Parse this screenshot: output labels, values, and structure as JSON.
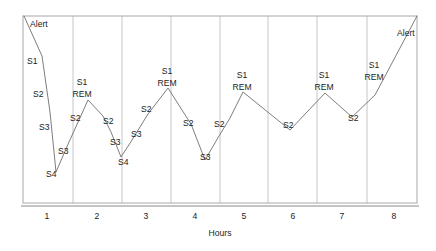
{
  "chart_data": {
    "type": "line",
    "title": "",
    "xlabel": "Hours",
    "ylabel": "",
    "xlim": [
      0.5,
      8.5
    ],
    "ylim": [
      0,
      5
    ],
    "grid": true,
    "legend_position": "none",
    "x_tick_labels": [
      "1",
      "2",
      "3",
      "4",
      "5",
      "6",
      "7",
      "8"
    ],
    "x_tick_values": [
      1,
      2,
      3,
      4,
      5,
      6,
      7,
      8
    ],
    "stage_levels": {
      "Alert": 5,
      "S1": 4,
      "REM": 4,
      "S2": 3,
      "S3": 2,
      "S4": 1
    },
    "series": [
      {
        "name": "Sleep stage",
        "points": [
          {
            "x": 0.5,
            "y": 5.0,
            "stage": "Alert"
          },
          {
            "x": 0.72,
            "y": 4.05,
            "stage": "S1"
          },
          {
            "x": 0.95,
            "y": 3.2,
            "stage": "S2"
          },
          {
            "x": 1.1,
            "y": 2.35,
            "stage": "S3"
          },
          {
            "x": 1.42,
            "y": 1.0,
            "stage": "S4"
          },
          {
            "x": 1.72,
            "y": 2.1,
            "stage": "S3"
          },
          {
            "x": 1.95,
            "y": 2.95,
            "stage": "S2"
          },
          {
            "x": 2.1,
            "y": 4.0,
            "stage": "S1 REM"
          },
          {
            "x": 2.48,
            "y": 2.95,
            "stage": "S2"
          },
          {
            "x": 2.72,
            "y": 2.3,
            "stage": "S3"
          },
          {
            "x": 2.95,
            "y": 1.42,
            "stage": "S4"
          },
          {
            "x": 3.2,
            "y": 2.35,
            "stage": "S3"
          },
          {
            "x": 3.42,
            "y": 3.15,
            "stage": "S2"
          },
          {
            "x": 3.62,
            "y": 4.2,
            "stage": "S1 REM"
          },
          {
            "x": 4.05,
            "y": 3.0,
            "stage": "S2"
          },
          {
            "x": 4.35,
            "y": 1.9,
            "stage": "S3"
          },
          {
            "x": 4.72,
            "y": 3.05,
            "stage": "S2"
          },
          {
            "x": 4.95,
            "y": 4.1,
            "stage": "S1 REM"
          },
          {
            "x": 5.62,
            "y": 2.75,
            "stage": "S2"
          },
          {
            "x": 6.35,
            "y": 4.05,
            "stage": "S1 REM"
          },
          {
            "x": 6.98,
            "y": 3.3,
            "stage": "S2"
          },
          {
            "x": 7.42,
            "y": 4.0,
            "stage": "S1 REM"
          },
          {
            "x": 8.5,
            "y": 5.0,
            "stage": "Alert"
          }
        ]
      }
    ],
    "annotations": [
      {
        "text": "Alert",
        "x_px": 30,
        "y_px": 25,
        "anchor": "start"
      },
      {
        "text": "S1",
        "x_px": 27,
        "y_px": 62,
        "anchor": "start"
      },
      {
        "text": "S2",
        "x_px": 33,
        "y_px": 95,
        "anchor": "start"
      },
      {
        "text": "S3",
        "x_px": 39,
        "y_px": 128,
        "anchor": "start"
      },
      {
        "text": "S4",
        "x_px": 46,
        "y_px": 175,
        "anchor": "start"
      },
      {
        "text": "S3",
        "x_px": 58,
        "y_px": 152,
        "anchor": "start"
      },
      {
        "text": "S2",
        "x_px": 70,
        "y_px": 119,
        "anchor": "start"
      },
      {
        "text": "S1",
        "x_px": 82,
        "y_px": 83,
        "anchor": "middle"
      },
      {
        "text": "REM",
        "x_px": 82,
        "y_px": 95,
        "anchor": "middle"
      },
      {
        "text": "S2",
        "x_px": 103,
        "y_px": 122,
        "anchor": "start"
      },
      {
        "text": "S3",
        "x_px": 110,
        "y_px": 143,
        "anchor": "start"
      },
      {
        "text": "S4",
        "x_px": 118,
        "y_px": 163,
        "anchor": "start"
      },
      {
        "text": "S3",
        "x_px": 131,
        "y_px": 135,
        "anchor": "start"
      },
      {
        "text": "S2",
        "x_px": 141,
        "y_px": 110,
        "anchor": "start"
      },
      {
        "text": "S1",
        "x_px": 167,
        "y_px": 72,
        "anchor": "middle"
      },
      {
        "text": "REM",
        "x_px": 167,
        "y_px": 84,
        "anchor": "middle"
      },
      {
        "text": "S2",
        "x_px": 183,
        "y_px": 124,
        "anchor": "start"
      },
      {
        "text": "S3",
        "x_px": 200,
        "y_px": 158,
        "anchor": "start"
      },
      {
        "text": "S2",
        "x_px": 214,
        "y_px": 125,
        "anchor": "start"
      },
      {
        "text": "S1",
        "x_px": 242,
        "y_px": 76,
        "anchor": "middle"
      },
      {
        "text": "REM",
        "x_px": 242,
        "y_px": 88,
        "anchor": "middle"
      },
      {
        "text": "S2",
        "x_px": 283,
        "y_px": 126,
        "anchor": "start"
      },
      {
        "text": "S1",
        "x_px": 324,
        "y_px": 76,
        "anchor": "middle"
      },
      {
        "text": "REM",
        "x_px": 324,
        "y_px": 88,
        "anchor": "middle"
      },
      {
        "text": "S2",
        "x_px": 348,
        "y_px": 119,
        "anchor": "start"
      },
      {
        "text": "S1",
        "x_px": 374,
        "y_px": 66,
        "anchor": "middle"
      },
      {
        "text": "REM",
        "x_px": 374,
        "y_px": 78,
        "anchor": "middle"
      },
      {
        "text": "Alert",
        "x_px": 397,
        "y_px": 34,
        "anchor": "start"
      }
    ],
    "line_vertices_px": [
      [
        24,
        16
      ],
      [
        42,
        56
      ],
      [
        46,
        84
      ],
      [
        50,
        112
      ],
      [
        56,
        172
      ],
      [
        69,
        142
      ],
      [
        79,
        120
      ],
      [
        88,
        100
      ],
      [
        103,
        116
      ],
      [
        111,
        132
      ],
      [
        121,
        157
      ],
      [
        132,
        140
      ],
      [
        148,
        114
      ],
      [
        168,
        88
      ],
      [
        182,
        110
      ],
      [
        191,
        124
      ],
      [
        205,
        160
      ],
      [
        219,
        136
      ],
      [
        230,
        118
      ],
      [
        243,
        92
      ],
      [
        290,
        130
      ],
      [
        325,
        93
      ],
      [
        352,
        117
      ],
      [
        375,
        95
      ],
      [
        417,
        16
      ]
    ],
    "grid_x_px": [
      73,
      122,
      171,
      220,
      268,
      317,
      367
    ],
    "frame": {
      "left_px": 23,
      "right_px": 417,
      "top_px": 16,
      "bottom_px": 203
    },
    "tick_px": [
      {
        "label": "1",
        "x": 47
      },
      {
        "label": "2",
        "x": 97
      },
      {
        "label": "3",
        "x": 146
      },
      {
        "label": "4",
        "x": 195
      },
      {
        "label": "5",
        "x": 244
      },
      {
        "label": "6",
        "x": 293
      },
      {
        "label": "7",
        "x": 342
      },
      {
        "label": "8",
        "x": 394
      }
    ],
    "colors": {
      "line": "#6e6e6e",
      "grid": "#b8b8b8",
      "frame": "#a8a8a8",
      "text": "#1c1c1c",
      "background": "#ffffff"
    }
  }
}
